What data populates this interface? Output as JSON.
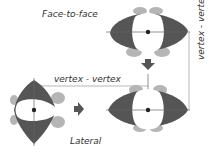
{
  "labels": {
    "face_to_face": "Face-to-face",
    "vertex_vertex_horizontal": "vertex - vertex",
    "vertex_vertex_vertical": "vertex - vertex",
    "lateral": "Lateral"
  },
  "colors": {
    "body_dark": "#555555",
    "lobe_light": "#b5b5b5",
    "center_white": "#ffffff",
    "axis_line": "#666666",
    "arrow": "#555555",
    "dim_line": "#999999"
  },
  "icons": [
    "down-arrow-icon",
    "right-arrow-icon"
  ]
}
